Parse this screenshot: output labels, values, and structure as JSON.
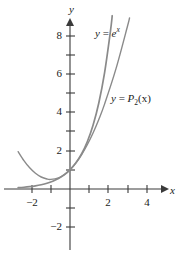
{
  "figure": {
    "background": "#ffffff",
    "axis_color": "#3a3a3a",
    "curve_color": "#8a8a8a",
    "curve_color_dark": "#7d7d7d",
    "width": 177,
    "height": 261
  },
  "axes": {
    "x_axis_label": "x",
    "y_axis_label": "y",
    "x_ticks": [
      {
        "value": -2,
        "label": "−2",
        "px": 32
      },
      {
        "value": -1,
        "label": "",
        "px": 51
      },
      {
        "value": 1,
        "label": "",
        "px": 89
      },
      {
        "value": 2,
        "label": "2",
        "px": 108
      },
      {
        "value": 3,
        "label": "",
        "px": 128
      },
      {
        "value": 4,
        "label": "4",
        "px": 147
      }
    ],
    "y_ticks": [
      {
        "value": 8,
        "label": "8",
        "px": 36
      },
      {
        "value": 7,
        "label": "",
        "px": 55
      },
      {
        "value": 6,
        "label": "6",
        "px": 74
      },
      {
        "value": 5,
        "label": "",
        "px": 93
      },
      {
        "value": 4,
        "label": "4",
        "px": 112
      },
      {
        "value": 3,
        "label": "",
        "px": 131
      },
      {
        "value": 2,
        "label": "2",
        "px": 151
      },
      {
        "value": 1,
        "label": "",
        "px": 170
      },
      {
        "value": -1,
        "label": "",
        "px": 208
      },
      {
        "value": -2,
        "label": "−2",
        "px": 227
      }
    ],
    "origin_px": {
      "x": 70,
      "y": 189
    },
    "unit_px": 19.2,
    "xlim": [
      -2.7,
      5.1
    ],
    "ylim": [
      -2.7,
      8.9
    ],
    "grid": false
  },
  "labels": {
    "exp_curve": {
      "y": "y",
      "equals": "=",
      "base": "e",
      "exponent": "x"
    },
    "poly_curve": {
      "y": "y",
      "equals": "=",
      "func": "P",
      "sub": "2",
      "arg": "(x)"
    }
  },
  "chart_data": {
    "type": "line",
    "title": "",
    "xlabel": "x",
    "ylabel": "y",
    "xlim": [
      -2.7,
      5.1
    ],
    "ylim": [
      -2.7,
      8.9
    ],
    "grid": false,
    "legend": "inline-annotations",
    "series": [
      {
        "name": "y = e^x",
        "formula": "e^x",
        "color": "#8a8a8a",
        "label_px": {
          "x": 95,
          "y": 28
        },
        "points": [
          {
            "x": -2.7,
            "y": 0.067
          },
          {
            "x": -2.4,
            "y": 0.091
          },
          {
            "x": -2.1,
            "y": 0.122
          },
          {
            "x": -1.8,
            "y": 0.165
          },
          {
            "x": -1.5,
            "y": 0.223
          },
          {
            "x": -1.2,
            "y": 0.301
          },
          {
            "x": -0.9,
            "y": 0.407
          },
          {
            "x": -0.6,
            "y": 0.549
          },
          {
            "x": -0.3,
            "y": 0.741
          },
          {
            "x": 0.0,
            "y": 1.0
          },
          {
            "x": 0.3,
            "y": 1.35
          },
          {
            "x": 0.6,
            "y": 1.822
          },
          {
            "x": 0.9,
            "y": 2.46
          },
          {
            "x": 1.2,
            "y": 3.32
          },
          {
            "x": 1.5,
            "y": 4.482
          },
          {
            "x": 1.8,
            "y": 6.05
          },
          {
            "x": 2.1,
            "y": 8.166
          },
          {
            "x": 2.2,
            "y": 9.025
          }
        ]
      },
      {
        "name": "y = P2(x)",
        "formula": "1 + x + x^2/2",
        "color": "#8a8a8a",
        "label_px": {
          "x": 111,
          "y": 93
        },
        "points": [
          {
            "x": -2.7,
            "y": 1.945
          },
          {
            "x": -2.4,
            "y": 1.48
          },
          {
            "x": -2.1,
            "y": 1.105
          },
          {
            "x": -1.8,
            "y": 0.82
          },
          {
            "x": -1.5,
            "y": 0.625
          },
          {
            "x": -1.2,
            "y": 0.52
          },
          {
            "x": -1.0,
            "y": 0.5
          },
          {
            "x": -0.6,
            "y": 0.58
          },
          {
            "x": -0.3,
            "y": 0.745
          },
          {
            "x": 0.0,
            "y": 1.0
          },
          {
            "x": 0.3,
            "y": 1.345
          },
          {
            "x": 0.6,
            "y": 1.78
          },
          {
            "x": 0.9,
            "y": 2.305
          },
          {
            "x": 1.2,
            "y": 2.92
          },
          {
            "x": 1.5,
            "y": 3.625
          },
          {
            "x": 1.8,
            "y": 4.42
          },
          {
            "x": 2.4,
            "y": 6.28
          },
          {
            "x": 3.0,
            "y": 8.5
          },
          {
            "x": 3.1,
            "y": 8.905
          }
        ]
      }
    ]
  }
}
